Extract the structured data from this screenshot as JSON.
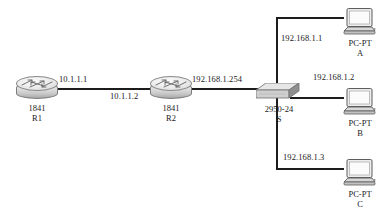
{
  "diagram": {
    "type": "network-topology",
    "line_color": "#1c1c1c",
    "background": "#ffffff"
  },
  "nodes": {
    "r1": {
      "icon": "router-icon",
      "model": "1841",
      "name": "R1"
    },
    "r2": {
      "icon": "router-icon",
      "model": "1841",
      "name": "R2"
    },
    "sw": {
      "icon": "switch-icon",
      "model": "2950-24",
      "name": "S"
    },
    "pc_a": {
      "icon": "pc-icon",
      "model": "PC-PT",
      "name": "A"
    },
    "pc_b": {
      "icon": "pc-icon",
      "model": "PC-PT",
      "name": "B"
    },
    "pc_c": {
      "icon": "pc-icon",
      "model": "PC-PT",
      "name": "C"
    }
  },
  "link_labels": {
    "r1_wan": "10.1.1.1",
    "r2_wan": "10.1.1.2",
    "r2_lan": "192.168.1.254",
    "pc_a_ip": "192.168.1.1",
    "pc_b_ip": "192.168.1.2",
    "pc_c_ip": "192.168.1.3"
  }
}
